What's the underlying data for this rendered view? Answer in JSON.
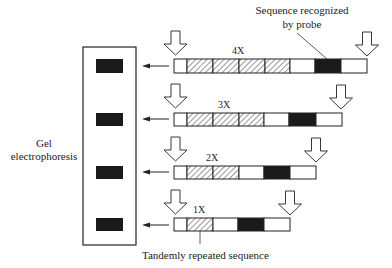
{
  "labels": {
    "probe_line1": "Sequence recognized",
    "probe_line2": "by probe",
    "gel_line1": "Gel",
    "gel_line2": "electrophoresis",
    "tandem": "Tandemly repeated sequence"
  },
  "colors": {
    "ink": "#222222",
    "band": "#1a1a1a",
    "background": "#ffffff"
  },
  "gel": {
    "x": 83,
    "y": 47,
    "w": 53,
    "h": 198
  },
  "rows": [
    {
      "count_label": "4X",
      "count_x": 238,
      "bar_y": 59,
      "bar_h": 14,
      "band_y": 59,
      "arrow_y": 66,
      "segments": [
        {
          "type": "plain",
          "x": 174,
          "w": 13
        },
        {
          "type": "repeat",
          "x": 187,
          "w": 26
        },
        {
          "type": "repeat",
          "x": 213,
          "w": 26
        },
        {
          "type": "repeat",
          "x": 239,
          "w": 26
        },
        {
          "type": "repeat",
          "x": 265,
          "w": 25
        },
        {
          "type": "plain",
          "x": 290,
          "w": 25
        },
        {
          "type": "probe",
          "x": 315,
          "w": 26
        },
        {
          "type": "plain",
          "x": 341,
          "w": 26
        }
      ],
      "cut_left_x": 175.5,
      "cut_right_x": 367,
      "cut_top": 31
    },
    {
      "count_label": "3X",
      "count_x": 224,
      "bar_y": 113,
      "bar_h": 13,
      "band_y": 113,
      "arrow_y": 119,
      "segments": [
        {
          "type": "plain",
          "x": 174,
          "w": 13
        },
        {
          "type": "repeat",
          "x": 187,
          "w": 26
        },
        {
          "type": "repeat",
          "x": 213,
          "w": 26
        },
        {
          "type": "repeat",
          "x": 239,
          "w": 25
        },
        {
          "type": "plain",
          "x": 264,
          "w": 25
        },
        {
          "type": "probe",
          "x": 289,
          "w": 27
        },
        {
          "type": "plain",
          "x": 316,
          "w": 26
        }
      ],
      "cut_left_x": 175.5,
      "cut_right_x": 341,
      "cut_top": 84
    },
    {
      "count_label": "2X",
      "count_x": 212,
      "bar_y": 166,
      "bar_h": 13,
      "band_y": 166,
      "arrow_y": 172,
      "segments": [
        {
          "type": "plain",
          "x": 174,
          "w": 13
        },
        {
          "type": "repeat",
          "x": 187,
          "w": 26
        },
        {
          "type": "repeat",
          "x": 213,
          "w": 26
        },
        {
          "type": "plain",
          "x": 239,
          "w": 25
        },
        {
          "type": "probe",
          "x": 264,
          "w": 26
        },
        {
          "type": "plain",
          "x": 290,
          "w": 26
        }
      ],
      "cut_left_x": 175.5,
      "cut_right_x": 316,
      "cut_top": 137
    },
    {
      "count_label": "1X",
      "count_x": 199,
      "bar_y": 218,
      "bar_h": 13,
      "band_y": 218,
      "arrow_y": 225,
      "segments": [
        {
          "type": "plain",
          "x": 174,
          "w": 13
        },
        {
          "type": "repeat",
          "x": 187,
          "w": 26
        },
        {
          "type": "plain",
          "x": 213,
          "w": 25
        },
        {
          "type": "probe",
          "x": 238,
          "w": 26
        },
        {
          "type": "plain",
          "x": 264,
          "w": 26
        }
      ],
      "cut_left_x": 175.5,
      "cut_right_x": 290,
      "cut_top": 190
    }
  ]
}
